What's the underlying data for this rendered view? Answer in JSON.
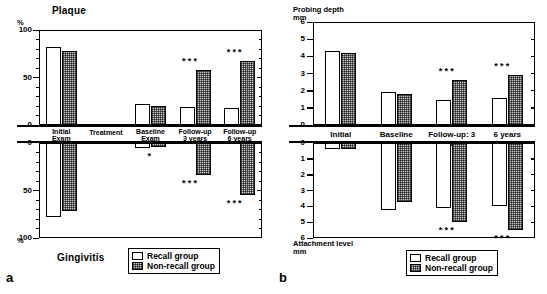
{
  "figure": {
    "panel_a_letter": "a",
    "panel_b_letter": "b"
  },
  "legend": {
    "recall": "Recall group",
    "nonrecall": "Non-recall group"
  },
  "panel_a": {
    "top_title": "Plaque",
    "bottom_title": "Gingivitis",
    "unit_top": "%",
    "unit_bottom": "%",
    "categories": [
      "Initial Exam",
      "Treatment",
      "Baseline Exam",
      "Follow-up 3 years",
      "Follow-up 6 years"
    ],
    "category_lines": [
      [
        "Initial",
        "Exam"
      ],
      [
        "Treatment",
        ""
      ],
      [
        "Baseline",
        "Exam"
      ],
      [
        "Follow-up",
        "3 years"
      ],
      [
        "Follow-up",
        "6 years"
      ]
    ],
    "ticks_top": [
      "100",
      "50",
      "0"
    ],
    "ticks_bottom": [
      "0",
      "50",
      "100"
    ]
  },
  "panel_b": {
    "top_title": "Probing depth",
    "top_unit": "mm",
    "bottom_title": "Attachment level",
    "bottom_unit": "mm",
    "categories": [
      "Initial",
      "Baseline",
      "Follow-up: 3 years",
      "6 years"
    ],
    "ticks_top": [
      "6",
      "5",
      "4",
      "3",
      "2",
      "1",
      "0"
    ],
    "ticks_bottom": [
      "0",
      "1",
      "2",
      "3",
      "4",
      "5",
      "6"
    ]
  },
  "chart_data": [
    {
      "type": "bar",
      "id": "plaque",
      "panel": "a",
      "title": "Plaque",
      "ylabel": "%",
      "ylim": [
        0,
        100
      ],
      "ytick_values": [
        0,
        50,
        100
      ],
      "yminor_step": 10,
      "direction": "up",
      "categories": [
        "Initial Exam",
        "Treatment",
        "Baseline Exam",
        "Follow-up 3 years",
        "Follow-up 6 years"
      ],
      "series": [
        {
          "name": "Recall group",
          "values": [
            82,
            null,
            22,
            19,
            18
          ]
        },
        {
          "name": "Non-recall group",
          "values": [
            78,
            null,
            20,
            58,
            67
          ]
        }
      ],
      "significance": [
        null,
        null,
        null,
        "***",
        "***"
      ],
      "grid": false,
      "legend_position": "bottom-right"
    },
    {
      "type": "bar",
      "id": "gingivitis",
      "panel": "a",
      "title": "Gingivitis",
      "ylabel": "%",
      "ylim": [
        0,
        100
      ],
      "ytick_values": [
        0,
        50,
        100
      ],
      "yminor_step": 10,
      "direction": "down",
      "categories": [
        "Initial Exam",
        "Treatment",
        "Baseline Exam",
        "Follow-up 3 years",
        "Follow-up 6 years"
      ],
      "series": [
        {
          "name": "Recall group",
          "values": [
            78,
            null,
            5,
            0,
            0
          ]
        },
        {
          "name": "Non-recall group",
          "values": [
            72,
            null,
            4,
            34,
            55
          ]
        }
      ],
      "significance": [
        null,
        null,
        "*",
        "***",
        "***"
      ],
      "grid": false,
      "legend_position": "bottom-right"
    },
    {
      "type": "bar",
      "id": "probing-depth",
      "panel": "b",
      "title": "Probing depth",
      "ylabel": "mm",
      "ylim": [
        0,
        6
      ],
      "ytick_values": [
        0,
        1,
        2,
        3,
        4,
        5,
        6
      ],
      "direction": "up",
      "categories": [
        "Initial",
        "Baseline",
        "Follow-up: 3 years",
        "6 years"
      ],
      "series": [
        {
          "name": "Recall group",
          "values": [
            4.3,
            1.9,
            1.45,
            1.6
          ]
        },
        {
          "name": "Non-recall group",
          "values": [
            4.2,
            1.8,
            2.6,
            2.9
          ]
        }
      ],
      "significance": [
        null,
        null,
        "***",
        "***"
      ],
      "grid": false,
      "legend_position": "bottom-right"
    },
    {
      "type": "bar",
      "id": "attachment-level",
      "panel": "b",
      "title": "Attachment level",
      "ylabel": "mm",
      "ylim": [
        0,
        6
      ],
      "ytick_values": [
        0,
        1,
        2,
        3,
        4,
        5,
        6
      ],
      "direction": "down",
      "categories": [
        "Initial",
        "Baseline",
        "Follow-up: 3 years",
        "6 years"
      ],
      "series": [
        {
          "name": "Recall group",
          "values": [
            0.35,
            4.2,
            4.1,
            4.0
          ]
        },
        {
          "name": "Non-recall group",
          "values": [
            0.4,
            3.75,
            5.0,
            5.5
          ]
        }
      ],
      "significance": [
        null,
        null,
        "***",
        "***"
      ],
      "grid": false,
      "legend_position": "bottom-right"
    }
  ]
}
